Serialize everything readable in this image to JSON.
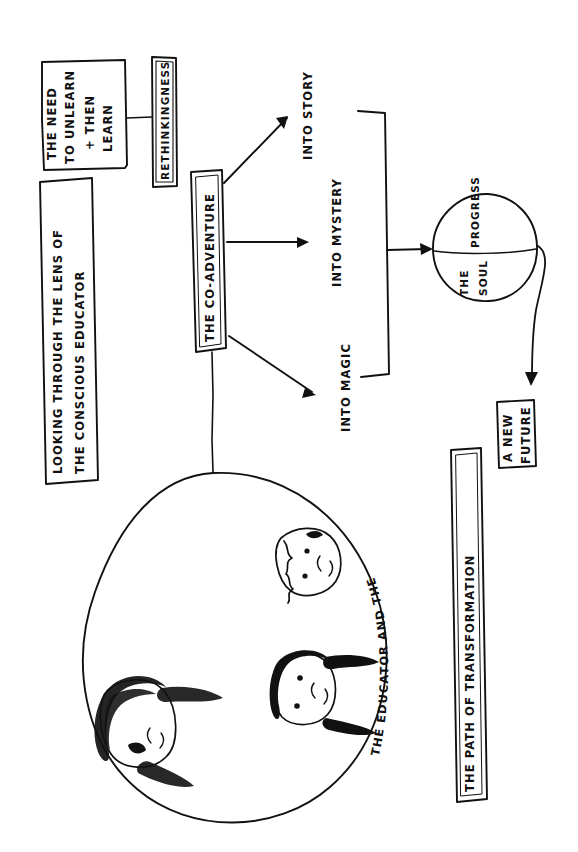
{
  "page": {
    "title": "Looking Through the Lens of the Conscious Educator",
    "background_color": "#ffffff",
    "ink_color": "#111111",
    "orientation_note": "All text rotated 90 degrees (sideways hand-drawn sketch)"
  },
  "nodes": {
    "need_to_unlearn": {
      "line1": "THE NEED",
      "line2": "TO UNLEARN",
      "line3": "+ THEN",
      "line4": "LEARN",
      "shape": "rectangle"
    },
    "rethinkingness": {
      "label": "RETHINKINGNESS",
      "shape": "tall-rectangle"
    },
    "lens_banner": {
      "line1": "LOOKING THROUGH THE LENS OF",
      "line2": "THE CONSCIOUS EDUCATOR",
      "shape": "long-rectangle"
    },
    "co_adventure": {
      "label": "THE CO-ADVENTURE",
      "shape": "tall-rectangle"
    },
    "branch_story": {
      "label": "INTO STORY"
    },
    "branch_mystery": {
      "label": "INTO MYSTERY"
    },
    "branch_magic": {
      "label": "INTO MAGIC"
    },
    "soul_circle": {
      "label_top": "PROGRESS",
      "label_bottom_line1": "THE",
      "label_bottom_line2": "SOUL",
      "shape": "circle-with-divider"
    },
    "new_future": {
      "line1": "A NEW",
      "line2": "FUTURE",
      "shape": "rectangle"
    },
    "children_circle": {
      "curved_label": "THE EDUCATOR AND THE CHILDREN",
      "shape": "large-circle",
      "figures": [
        "child-face",
        "adult-face-dark-hair",
        "adult-face-long-hair"
      ]
    },
    "path_banner": {
      "label": "THE PATH OF TRANSFORMATION",
      "shape": "long-rectangle"
    }
  },
  "connectors": {
    "unlearn_to_rethinking": "line",
    "coadventure_to_story": "arrow",
    "coadventure_to_mystery": "arrow",
    "coadventure_to_magic": "arrow",
    "branches_to_soul": "bracket-arrow",
    "soul_to_future": "curved-arrow",
    "coadventure_to_children": "line"
  }
}
